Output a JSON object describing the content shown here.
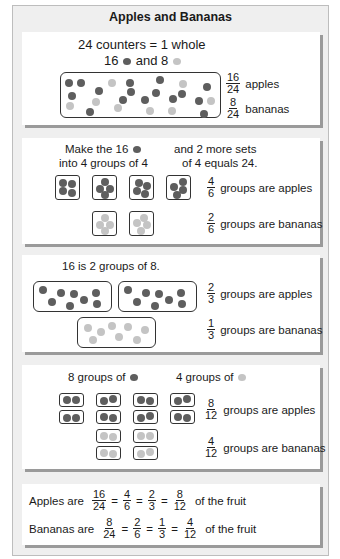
{
  "title": "Apples and Bananas",
  "colors": {
    "apple": "#5e5e5e",
    "banana": "#c4c4c4",
    "frame": "#efefef",
    "panel_shadow": "#9a9a9a"
  },
  "panel1": {
    "line1": "24 counters = 1 whole",
    "line2_a": "16",
    "line2_b": "and 8",
    "apples_frac": {
      "n": "16",
      "d": "24"
    },
    "apples_label": "apples",
    "bananas_frac": {
      "n": "8",
      "d": "24"
    },
    "bananas_label": "bananas"
  },
  "panel2": {
    "left_line1": "Make the 16",
    "left_line2": "into 4 groups of 4",
    "right_line1": "and 2 more sets",
    "right_line2": "of 4 equals 24.",
    "apples_frac": {
      "n": "4",
      "d": "6"
    },
    "apples_label": "groups are apples",
    "bananas_frac": {
      "n": "2",
      "d": "6"
    },
    "bananas_label": "groups are bananas"
  },
  "panel3": {
    "heading": "16 is 2 groups of 8.",
    "apples_frac": {
      "n": "2",
      "d": "3"
    },
    "apples_label": "groups are apples",
    "bananas_frac": {
      "n": "1",
      "d": "3"
    },
    "bananas_label": "groups are bananas"
  },
  "panel4": {
    "left_heading": "8 groups of",
    "right_heading": "4 groups of",
    "apples_frac": {
      "n": "8",
      "d": "12"
    },
    "apples_label": "groups are apples",
    "bananas_frac": {
      "n": "4",
      "d": "12"
    },
    "bananas_label": "groups are bananas"
  },
  "summary": {
    "apples_prefix": "Apples are",
    "apples_fracs": [
      {
        "n": "16",
        "d": "24"
      },
      {
        "n": "4",
        "d": "6"
      },
      {
        "n": "2",
        "d": "3"
      },
      {
        "n": "8",
        "d": "12"
      }
    ],
    "apples_suffix": "of the fruit",
    "bananas_prefix": "Bananas are",
    "bananas_fracs": [
      {
        "n": "8",
        "d": "24"
      },
      {
        "n": "2",
        "d": "6"
      },
      {
        "n": "1",
        "d": "3"
      },
      {
        "n": "4",
        "d": "12"
      }
    ],
    "bananas_suffix": "of the fruit",
    "equals": "="
  }
}
